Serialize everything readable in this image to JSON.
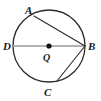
{
  "figure": {
    "type": "circle-geometry-diagram",
    "background_color": "#ffffff",
    "circle": {
      "name": "circle-Q",
      "center_x": 49,
      "center_y": 46,
      "radius": 36,
      "stroke_color": "#2b2b2b",
      "stroke_width": 1.3,
      "fill": "none"
    },
    "center_dot": {
      "name": "center-point-Q",
      "x": 49,
      "y": 46,
      "radius": 2.6,
      "color": "#111111"
    },
    "points": [
      {
        "id": "A",
        "label": "A",
        "x": 34,
        "y": 16,
        "label_x": 25,
        "label_y": 5
      },
      {
        "id": "D",
        "label": "D",
        "x": 13,
        "y": 46,
        "label_x": 3,
        "label_y": 41
      },
      {
        "id": "B",
        "label": "B",
        "x": 85,
        "y": 46,
        "label_x": 88,
        "label_y": 41
      },
      {
        "id": "C",
        "label": "C",
        "x": 57,
        "y": 81,
        "label_x": 44,
        "label_y": 87
      },
      {
        "id": "Q",
        "label": "Q",
        "x": 49,
        "y": 46,
        "label_x": 43,
        "label_y": 52
      }
    ],
    "segments": [
      {
        "id": "DB",
        "name": "diameter-D-B",
        "from": "D",
        "to": "B",
        "x1": 13,
        "y1": 46,
        "x2": 85,
        "y2": 46,
        "stroke_color": "#9a9a9a",
        "stroke_width": 1.5,
        "kind": "diameter"
      },
      {
        "id": "AB",
        "name": "chord-A-B",
        "from": "A",
        "to": "B",
        "x1": 34,
        "y1": 16,
        "x2": 85,
        "y2": 46,
        "stroke_color": "#2b2b2b",
        "stroke_width": 1.1,
        "kind": "chord"
      },
      {
        "id": "CB",
        "name": "chord-C-B",
        "from": "C",
        "to": "B",
        "x1": 57,
        "y1": 81,
        "x2": 85,
        "y2": 46,
        "stroke_color": "#2b2b2b",
        "stroke_width": 1.1,
        "kind": "chord"
      }
    ],
    "labels": {
      "A": "A",
      "B": "B",
      "C": "C",
      "D": "D",
      "Q": "Q"
    }
  }
}
